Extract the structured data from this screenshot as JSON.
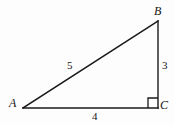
{
  "figure": {
    "kind": "right-triangle-diagram",
    "background_color": "#fdfdfd",
    "stroke_color": "#1a1a1a",
    "label_color": "#141414"
  },
  "vertices": {
    "a": {
      "label": "A",
      "x": 23,
      "y": 108
    },
    "b": {
      "label": "B",
      "x": 158,
      "y": 21
    },
    "c": {
      "label": "C",
      "x": 158,
      "y": 108
    }
  },
  "sides": {
    "hypotenuse": {
      "label": "5",
      "from": "A",
      "to": "B"
    },
    "vertical": {
      "label": "3",
      "from": "B",
      "to": "C"
    },
    "horizontal": {
      "label": "4",
      "from": "A",
      "to": "C"
    }
  },
  "right_angle": {
    "at_vertex": "C",
    "marker": "square",
    "size": 10
  },
  "geometry_paths": {
    "hypotenuse_path": "M 23 108 L 158 21",
    "vertical_path": "M 158 21 L 158 108",
    "horizontal_path": "M 23 108 L 158 108",
    "right_angle_path": "M 148 108 L 148 98 L 158 98"
  }
}
